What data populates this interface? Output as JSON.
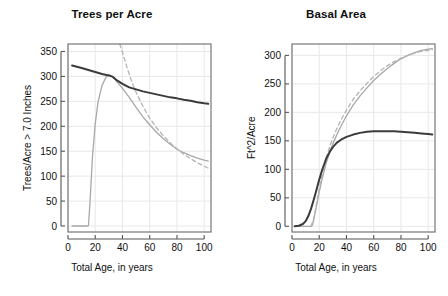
{
  "figure": {
    "background": "#ffffff",
    "width": 448,
    "height": 296
  },
  "panels": [
    {
      "key": "trees_per_acre",
      "title": "Trees per Acre",
      "xlabel": "Total Age, in years",
      "ylabel": "Trees/Acre > 7.0 Inches"
    },
    {
      "key": "basal_area",
      "title": "Basal Area",
      "xlabel": "Total Age, in years",
      "ylabel": "Ft^2/Acre"
    }
  ],
  "style": {
    "dark_line_color": "#3b3b3b",
    "grey_line_color": "#a8a8a8",
    "grid_color": "#e8e8e8",
    "axis_color": "#555555",
    "box_color": "#777777"
  },
  "chart_data": [
    {
      "type": "line",
      "title": "Trees per Acre",
      "xlabel": "Total Age, in years",
      "ylabel": "Trees/Acre > 7.0 Inches",
      "xlim": [
        0,
        105
      ],
      "ylim": [
        -12,
        365
      ],
      "xticks": [
        0,
        20,
        40,
        60,
        80,
        100
      ],
      "yticks": [
        0,
        50,
        100,
        150,
        200,
        250,
        300,
        350
      ],
      "grid": true,
      "legend": "none",
      "series": [
        {
          "name": "dark-solid",
          "style": "solid",
          "color": "#3b3b3b",
          "x": [
            3,
            10,
            15,
            20,
            25,
            30,
            33,
            36,
            40,
            45,
            50,
            55,
            60,
            65,
            70,
            75,
            80,
            85,
            90,
            95,
            100,
            103
          ],
          "values": [
            322,
            317,
            313,
            309,
            305,
            302,
            299,
            292,
            285,
            278,
            274,
            270,
            267,
            264,
            261,
            258,
            256,
            253,
            251,
            248,
            246,
            245
          ]
        },
        {
          "name": "grey-solid",
          "style": "solid",
          "color": "#a8a8a8",
          "x": [
            3,
            8,
            12,
            14,
            15,
            16,
            18,
            20,
            22,
            25,
            28,
            30,
            32,
            34,
            36,
            40,
            45,
            50,
            55,
            60,
            65,
            70,
            75,
            80,
            85,
            90,
            95,
            100,
            103
          ],
          "values": [
            0,
            0,
            0,
            0,
            1,
            40,
            140,
            205,
            248,
            282,
            299,
            303,
            301,
            296,
            289,
            276,
            258,
            238,
            219,
            203,
            188,
            175,
            164,
            154,
            147,
            141,
            136,
            132,
            130
          ]
        },
        {
          "name": "grey-dashed",
          "style": "dashed",
          "color": "#b4b4b4",
          "x": [
            38,
            40,
            42,
            44,
            46,
            48,
            50,
            55,
            60,
            65,
            70,
            75,
            80,
            85,
            90,
            95,
            100,
            103
          ],
          "values": [
            365,
            348,
            330,
            312,
            296,
            281,
            268,
            240,
            216,
            197,
            181,
            167,
            155,
            144,
            135,
            127,
            120,
            116
          ]
        }
      ]
    },
    {
      "type": "line",
      "title": "Basal Area",
      "xlabel": "Total Age, in years",
      "ylabel": "Ft^2/Acre",
      "xlim": [
        0,
        105
      ],
      "ylim": [
        -10,
        320
      ],
      "xticks": [
        0,
        20,
        40,
        60,
        80,
        100
      ],
      "yticks": [
        0,
        50,
        100,
        150,
        200,
        250,
        300
      ],
      "grid": true,
      "legend": "none",
      "series": [
        {
          "name": "dark-solid",
          "style": "solid",
          "color": "#3b3b3b",
          "x": [
            2,
            5,
            8,
            10,
            12,
            14,
            16,
            18,
            20,
            22,
            25,
            28,
            30,
            33,
            36,
            40,
            45,
            50,
            55,
            60,
            65,
            70,
            75,
            80,
            85,
            90,
            95,
            100,
            103
          ],
          "values": [
            0,
            1,
            4,
            9,
            18,
            31,
            47,
            64,
            82,
            98,
            118,
            132,
            139,
            147,
            152,
            157,
            161,
            164,
            166,
            167,
            167,
            167,
            167,
            166,
            165,
            164,
            163,
            162,
            161
          ]
        },
        {
          "name": "grey-solid",
          "style": "solid",
          "color": "#a8a8a8",
          "x": [
            2,
            10,
            14,
            15,
            16,
            18,
            20,
            22,
            25,
            28,
            30,
            33,
            36,
            40,
            45,
            50,
            55,
            60,
            65,
            70,
            75,
            80,
            85,
            90,
            95,
            100,
            103
          ],
          "values": [
            0,
            0,
            0,
            2,
            12,
            36,
            60,
            82,
            110,
            132,
            145,
            161,
            176,
            194,
            213,
            229,
            243,
            256,
            267,
            277,
            286,
            294,
            300,
            305,
            309,
            311,
            312
          ]
        },
        {
          "name": "grey-dashed",
          "style": "dashed",
          "color": "#b4b4b4",
          "x": [
            14,
            16,
            18,
            20,
            22,
            25,
            28,
            30,
            33,
            36,
            40,
            45,
            50,
            55,
            60,
            65,
            70,
            75,
            80,
            85,
            90,
            95,
            100,
            103
          ],
          "values": [
            0,
            14,
            40,
            66,
            89,
            119,
            142,
            155,
            172,
            187,
            204,
            223,
            238,
            251,
            263,
            273,
            282,
            289,
            295,
            300,
            304,
            307,
            309,
            310
          ]
        }
      ]
    }
  ]
}
